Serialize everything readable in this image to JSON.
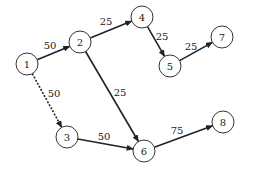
{
  "diagram": {
    "type": "directed-network",
    "nodes": [
      {
        "id": "1",
        "label": "1",
        "x": 27,
        "y": 64
      },
      {
        "id": "2",
        "label": "2",
        "x": 80,
        "y": 42
      },
      {
        "id": "3",
        "label": "3",
        "x": 67,
        "y": 137
      },
      {
        "id": "4",
        "label": "4",
        "x": 142,
        "y": 17
      },
      {
        "id": "5",
        "label": "5",
        "x": 170,
        "y": 66
      },
      {
        "id": "6",
        "label": "6",
        "x": 144,
        "y": 151
      },
      {
        "id": "7",
        "label": "7",
        "x": 222,
        "y": 37
      },
      {
        "id": "8",
        "label": "8",
        "x": 223,
        "y": 122
      }
    ],
    "edges": [
      {
        "from": "1",
        "to": "2",
        "weight": "50",
        "style": "solid",
        "lx": 50,
        "ly": 49
      },
      {
        "from": "1",
        "to": "3",
        "weight": "50",
        "style": "dashed",
        "lx": 54,
        "ly": 97
      },
      {
        "from": "2",
        "to": "4",
        "weight": "25",
        "style": "solid",
        "lx": 106,
        "ly": 25
      },
      {
        "from": "2",
        "to": "6",
        "weight": "25",
        "style": "solid",
        "lx": 120,
        "ly": 96
      },
      {
        "from": "4",
        "to": "5",
        "weight": "25",
        "style": "solid",
        "lx": 162,
        "ly": 40
      },
      {
        "from": "5",
        "to": "7",
        "weight": "25",
        "style": "solid",
        "lx": 191,
        "ly": 50
      },
      {
        "from": "3",
        "to": "6",
        "weight": "50",
        "style": "solid",
        "lx": 104,
        "ly": 140
      },
      {
        "from": "6",
        "to": "8",
        "weight": "75",
        "style": "solid",
        "lx": 177,
        "ly": 134
      }
    ]
  }
}
